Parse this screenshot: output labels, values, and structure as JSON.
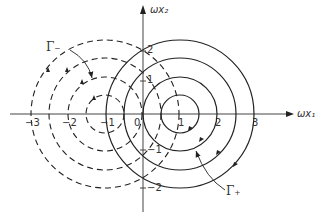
{
  "figure": {
    "x_axis_label": "ωx₁",
    "y_axis_label": "ωx₂",
    "x_ticks": [
      "−3",
      "−2",
      "−1",
      "0",
      "1",
      "2",
      "3"
    ],
    "y_ticks": [
      "2",
      "1",
      "−1",
      "−2"
    ],
    "curve_labels": {
      "gamma_minus": "Γ₋",
      "gamma_plus": "Γ₊"
    },
    "solid_circles": {
      "center": [
        1,
        0
      ],
      "radii": [
        0.5,
        1,
        1.5,
        2
      ],
      "style": "solid",
      "direction": "clockwise"
    },
    "dashed_circles": {
      "center": [
        -1,
        0
      ],
      "radii": [
        0.5,
        1,
        1.5,
        2
      ],
      "style": "dashed",
      "direction": "counterclockwise"
    },
    "line_color": "#222222"
  }
}
